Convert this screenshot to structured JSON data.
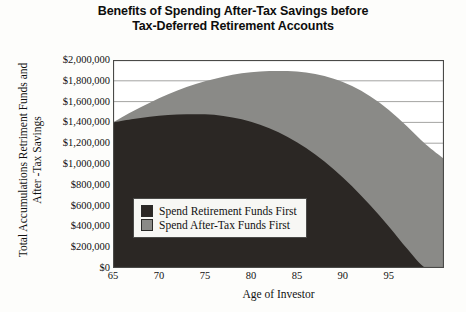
{
  "title": {
    "line1": "Benefits of Spending After-Tax Savings before",
    "line2": "Tax-Deferred Retirement Accounts"
  },
  "axes": {
    "y_title_line1": "Total Accumulations Retriment Funds and",
    "y_title_line2": "After -Tax Savings",
    "x_title": "Age of Investor",
    "y_ticks": [
      "$2,000,000",
      "$1,800,000",
      "$1,600,000",
      "$1,400,000",
      "$1,200,000",
      "$1,000,000",
      "$800,000",
      "$600,000",
      "$400,000",
      "$200,000",
      "$0"
    ],
    "x_ticks": [
      "65",
      "70",
      "75",
      "80",
      "85",
      "90",
      "95"
    ]
  },
  "legend": {
    "items": [
      {
        "label": "Spend Retirement Funds First",
        "color": "#2b2724"
      },
      {
        "label": "Spend After-Tax Funds First",
        "color": "#8a8a87"
      }
    ]
  },
  "colors": {
    "dark_series": "#2b2724",
    "light_series": "#8a8a87",
    "axis": "#4a4a48",
    "grid": "#8d8d8a",
    "background": "#fdfdfb"
  },
  "chart_data": {
    "type": "area",
    "title": "Benefits of Spending After-Tax Savings before Tax-Deferred Retirement Accounts",
    "xlabel": "Age of Investor",
    "ylabel": "Total Accumulations Retriment Funds and After -Tax Savings",
    "xlim": [
      65,
      101
    ],
    "ylim": [
      0,
      2000000
    ],
    "ytick_values": [
      2000000,
      1800000,
      1600000,
      1400000,
      1200000,
      1000000,
      800000,
      600000,
      400000,
      200000,
      0
    ],
    "xtick_values": [
      65,
      70,
      75,
      80,
      85,
      90,
      95
    ],
    "grid": true,
    "legend_position": "inside-center",
    "x": [
      65,
      67,
      69,
      71,
      73,
      75,
      77,
      79,
      81,
      83,
      85,
      87,
      89,
      91,
      93,
      95,
      97,
      99,
      101
    ],
    "series": [
      {
        "name": "Spend After-Tax Funds First",
        "color": "#8a8a87",
        "values": [
          1400000,
          1500000,
          1590000,
          1670000,
          1740000,
          1795000,
          1840000,
          1872000,
          1890000,
          1895000,
          1890000,
          1865000,
          1820000,
          1750000,
          1650000,
          1520000,
          1360000,
          1190000,
          1050000
        ]
      },
      {
        "name": "Spend Retirement Funds First",
        "color": "#2b2724",
        "values": [
          1400000,
          1430000,
          1455000,
          1470000,
          1478000,
          1478000,
          1462000,
          1430000,
          1378000,
          1305000,
          1210000,
          1092000,
          950000,
          785000,
          600000,
          400000,
          185000,
          0,
          0
        ]
      }
    ]
  }
}
